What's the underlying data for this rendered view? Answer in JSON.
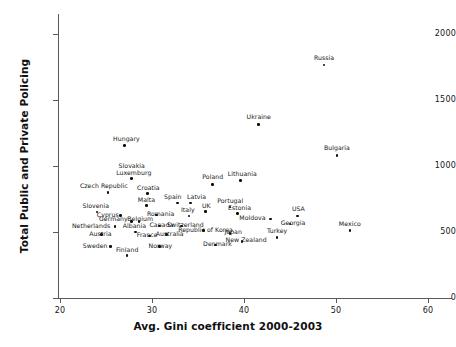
{
  "chart_data": {
    "type": "scatter",
    "title": "",
    "xlabel": "Avg. Gini coefficient 2000-2003",
    "ylabel": "Total Public and Private Policing",
    "xlim": [
      17,
      62
    ],
    "ylim": [
      0,
      2160
    ],
    "xticks": [
      20,
      30,
      40,
      50,
      60
    ],
    "yticks": [
      0,
      500,
      1000,
      1500,
      2000
    ],
    "grid": false,
    "legend": null,
    "marker_color": "#0d0d0d",
    "axis_color": "#5a5a5a",
    "points": [
      {
        "label": "Russia",
        "x": 48.7,
        "y": 1765,
        "lx": 0,
        "ly": -10,
        "align": "lab-c"
      },
      {
        "label": "Ukraine",
        "x": 41.6,
        "y": 1315,
        "lx": 0,
        "ly": -10,
        "align": "lab-c"
      },
      {
        "label": "Bulgaria",
        "x": 50.1,
        "y": 1080,
        "lx": 0,
        "ly": -10,
        "align": "lab-c"
      },
      {
        "label": "Hungary",
        "x": 27.0,
        "y": 1155,
        "lx": 2,
        "ly": -10,
        "align": "lab-c"
      },
      {
        "label": "Slovakia",
        "x": 27.8,
        "y": 905,
        "lx": 0,
        "ly": -16,
        "align": "lab-c"
      },
      {
        "label": "Luxemburg",
        "x": 27.8,
        "y": 905,
        "lx": 2,
        "ly": -9,
        "align": "lab-c"
      },
      {
        "label": "Poland",
        "x": 36.6,
        "y": 860,
        "lx": 0,
        "ly": -10,
        "align": "lab-c"
      },
      {
        "label": "Lithuania",
        "x": 39.6,
        "y": 890,
        "lx": 2,
        "ly": -10,
        "align": "lab-c"
      },
      {
        "label": "Czech Republic",
        "x": 25.2,
        "y": 800,
        "lx": -4,
        "ly": -9,
        "align": "lab-c"
      },
      {
        "label": "Croatia",
        "x": 29.5,
        "y": 790,
        "lx": 1,
        "ly": -9,
        "align": "lab-c"
      },
      {
        "label": "Spain",
        "x": 32.8,
        "y": 720,
        "lx": -5,
        "ly": -9,
        "align": "lab-c"
      },
      {
        "label": "Latvia",
        "x": 34.2,
        "y": 720,
        "lx": 6,
        "ly": -9,
        "align": "lab-c"
      },
      {
        "label": "Malta",
        "x": 29.4,
        "y": 700,
        "lx": 0,
        "ly": -9,
        "align": "lab-c"
      },
      {
        "label": "Portugal",
        "x": 38.5,
        "y": 690,
        "lx": 0,
        "ly": -9,
        "align": "lab-c"
      },
      {
        "label": "Slovenia",
        "x": 24.0,
        "y": 650,
        "lx": -1,
        "ly": -9,
        "align": "lab-c"
      },
      {
        "label": "Cyprus",
        "x": 26.6,
        "y": 625,
        "lx": -2,
        "ly": -4,
        "align": "lab-r"
      },
      {
        "label": "Romania",
        "x": 30.5,
        "y": 630,
        "lx": 4,
        "ly": -4,
        "align": "lab-c"
      },
      {
        "label": "Italy",
        "x": 34.0,
        "y": 620,
        "lx": -1,
        "ly": -9,
        "align": "lab-c"
      },
      {
        "label": "UK",
        "x": 35.8,
        "y": 655,
        "lx": 1,
        "ly": -9,
        "align": "lab-c"
      },
      {
        "label": "Estonia",
        "x": 39.3,
        "y": 640,
        "lx": 2,
        "ly": -9,
        "align": "lab-c"
      },
      {
        "label": "Moldova",
        "x": 42.9,
        "y": 600,
        "lx": -5,
        "ly": -4,
        "align": "lab-r"
      },
      {
        "label": "USA",
        "x": 45.8,
        "y": 620,
        "lx": 1,
        "ly": -10,
        "align": "lab-c"
      },
      {
        "label": "Georgia",
        "x": 45.0,
        "y": 560,
        "lx": 3,
        "ly": -4,
        "align": "lab-c"
      },
      {
        "label": "Netherlands",
        "x": 26.0,
        "y": 540,
        "lx": -5,
        "ly": -4,
        "align": "lab-r"
      },
      {
        "label": "Germany",
        "x": 27.8,
        "y": 580,
        "lx": -4,
        "ly": -5,
        "align": "lab-r"
      },
      {
        "label": "Belgium",
        "x": 28.6,
        "y": 580,
        "lx": 1,
        "ly": -5,
        "align": "lab-c"
      },
      {
        "label": "Canada",
        "x": 30.8,
        "y": 545,
        "lx": 2,
        "ly": -4,
        "align": "lab-c"
      },
      {
        "label": "Switzerland",
        "x": 33.2,
        "y": 545,
        "lx": 4,
        "ly": -4,
        "align": "lab-c"
      },
      {
        "label": "Republic of Korea",
        "x": 35.6,
        "y": 510,
        "lx": 2,
        "ly": -4,
        "align": "lab-c"
      },
      {
        "label": "Turkey",
        "x": 43.6,
        "y": 460,
        "lx": 0,
        "ly": -9,
        "align": "lab-c"
      },
      {
        "label": "Mexico",
        "x": 51.5,
        "y": 510,
        "lx": 0,
        "ly": -10,
        "align": "lab-c"
      },
      {
        "label": "Albania",
        "x": 28.2,
        "y": 500,
        "lx": -1,
        "ly": -9,
        "align": "lab-c"
      },
      {
        "label": "Austria",
        "x": 24.5,
        "y": 480,
        "lx": -1,
        "ly": -4,
        "align": "lab-c"
      },
      {
        "label": "France",
        "x": 29.7,
        "y": 470,
        "lx": -2,
        "ly": -4,
        "align": "lab-c"
      },
      {
        "label": "Australia",
        "x": 31.6,
        "y": 480,
        "lx": 3,
        "ly": -4,
        "align": "lab-c"
      },
      {
        "label": "Japan",
        "x": 38.5,
        "y": 490,
        "lx": 3,
        "ly": -4,
        "align": "lab-c"
      },
      {
        "label": "New Zealand",
        "x": 39.8,
        "y": 430,
        "lx": 4,
        "ly": -4,
        "align": "lab-c"
      },
      {
        "label": "Sweden",
        "x": 25.5,
        "y": 390,
        "lx": -3,
        "ly": -4,
        "align": "lab-r"
      },
      {
        "label": "Norway",
        "x": 30.8,
        "y": 390,
        "lx": 1,
        "ly": -4,
        "align": "lab-c"
      },
      {
        "label": "Denmark",
        "x": 36.9,
        "y": 400,
        "lx": 2,
        "ly": -4,
        "align": "lab-c"
      },
      {
        "label": "Finland",
        "x": 27.3,
        "y": 320,
        "lx": 0,
        "ly": -9,
        "align": "lab-c"
      }
    ]
  }
}
